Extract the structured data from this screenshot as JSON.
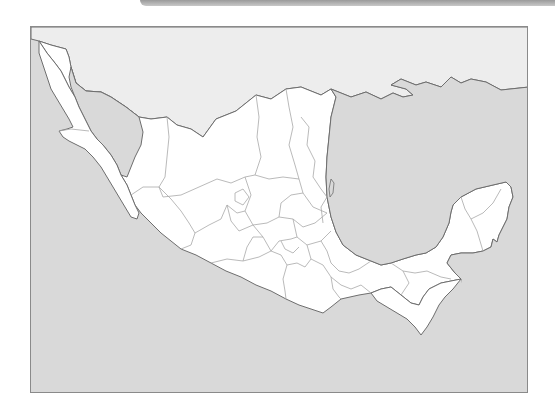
{
  "map": {
    "subject": "Mexico",
    "style": "blank outline map with state boundaries",
    "labels": [],
    "colors": {
      "ocean": "#d9d9d9",
      "neighbor_land": "#ededed",
      "mexico_land": "#ffffff",
      "coastline": "#6e6e6e",
      "state_border": "#a8a8a8",
      "frame_border": "#8a8a8a"
    },
    "regions": [
      "United States (north)",
      "Gulf of Mexico",
      "Pacific Ocean",
      "Gulf of California",
      "Baja California peninsula",
      "Yucatán peninsula"
    ]
  }
}
